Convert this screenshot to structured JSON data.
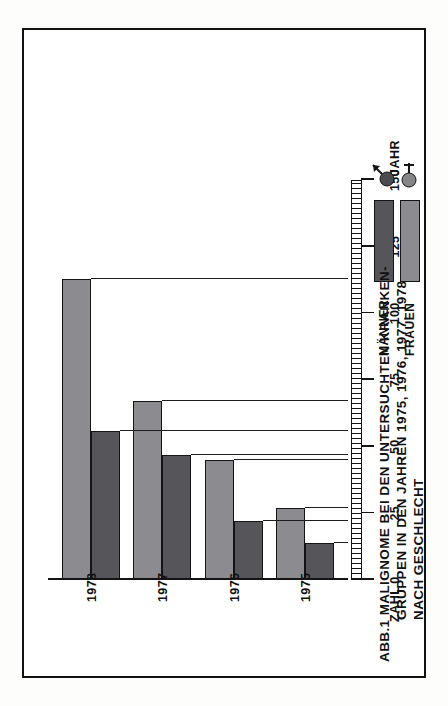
{
  "figure": {
    "caption_lines": [
      "ABB.1  MALIGNOME  BEI  DEN  UNTERSUCHTEN KRANKEN-",
      "GRUPPEN IN DEN JAHREN 1975, 1976, 1977, 1978",
      "NACH GESCHLECHT"
    ],
    "axis_value_title": "ZAHL",
    "axis_category_title": "JAHR"
  },
  "legend": {
    "rows": [
      {
        "label": "MÄNNER",
        "color": "#55555a",
        "symbol": "mars-symbol"
      },
      {
        "label": "FRAUEN",
        "color": "#8c8c90",
        "symbol": "venus-symbol"
      }
    ]
  },
  "chart_data": {
    "type": "bar",
    "xlabel": "JAHR",
    "ylabel": "ZAHL",
    "ylim": [
      0,
      150
    ],
    "yticks": [
      0,
      25,
      50,
      75,
      100,
      125,
      150
    ],
    "ytick_labels": [
      "0",
      "25",
      "50",
      "75",
      "100",
      "125",
      "150"
    ],
    "grid": true,
    "legend_position": "right",
    "orientation": "vertical-bars-rotated-90ccw",
    "categories": [
      "1975",
      "1976",
      "1977",
      "1978"
    ],
    "series": [
      {
        "name": "FRAUEN",
        "color": "#8c8c90",
        "values": [
          27,
          45,
          67,
          113
        ]
      },
      {
        "name": "MÄNNER",
        "color": "#55555a",
        "values": [
          14,
          22,
          47,
          56
        ]
      }
    ]
  }
}
